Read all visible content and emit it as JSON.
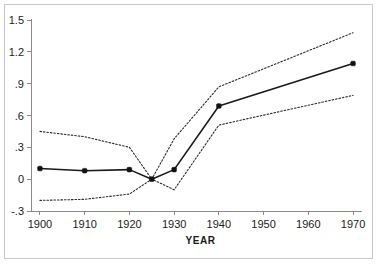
{
  "figure": {
    "background_color": "#ffffff",
    "frame_color": "#c9c9c9",
    "line_color": "#1a1a1a"
  },
  "chart_data": {
    "type": "line",
    "title": "",
    "subtitle": "",
    "xlabel": "YEAR",
    "ylabel": "",
    "xlim": [
      1898,
      1972
    ],
    "ylim": [
      -0.3,
      1.5
    ],
    "xticks": [
      1900,
      1910,
      1920,
      1930,
      1940,
      1950,
      1960,
      1970
    ],
    "xtick_labels": [
      "1900",
      "1910",
      "1920",
      "1930",
      "1940",
      "1950",
      "1960",
      "1970"
    ],
    "yticks": [
      -0.3,
      0,
      0.3,
      0.6,
      0.9,
      1.2,
      1.5
    ],
    "ytick_labels": [
      "-.3",
      "0",
      ".3",
      ".6",
      ".9",
      "1.2",
      "1.5"
    ],
    "grid": false,
    "legend": "none",
    "x": [
      1900,
      1910,
      1920,
      1925,
      1930,
      1940,
      1970
    ],
    "series": [
      {
        "name": "upper confidence limit",
        "style": "dotted",
        "markers": false,
        "values": [
          0.45,
          0.4,
          0.3,
          0.0,
          0.38,
          0.87,
          1.38
        ]
      },
      {
        "name": "point estimate",
        "style": "solid",
        "markers": true,
        "values": [
          0.1,
          0.08,
          0.09,
          0.0,
          0.09,
          0.69,
          1.09
        ]
      },
      {
        "name": "lower confidence limit",
        "style": "dotted",
        "markers": false,
        "values": [
          -0.2,
          -0.19,
          -0.14,
          0.0,
          -0.1,
          0.51,
          0.79
        ]
      }
    ],
    "marker_points": [
      {
        "x": 1900,
        "y": 0.1
      },
      {
        "x": 1910,
        "y": 0.08
      },
      {
        "x": 1920,
        "y": 0.09
      },
      {
        "x": 1925,
        "y": 0.0
      },
      {
        "x": 1930,
        "y": 0.09
      },
      {
        "x": 1940,
        "y": 0.69
      },
      {
        "x": 1970,
        "y": 1.09
      }
    ]
  }
}
